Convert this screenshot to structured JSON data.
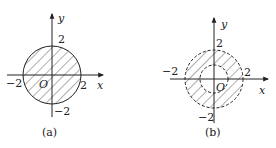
{
  "figures": [
    {
      "id": "a",
      "caption": "(a)",
      "axis_x_label": "x",
      "axis_y_label": "y",
      "origin_label": "O",
      "tick_x_neg": "−2",
      "tick_x_pos": "2",
      "tick_y_pos": "2",
      "tick_y_neg": "−2",
      "description": "Solid circle of radius 2 centered at origin, entire disk hatched"
    },
    {
      "id": "b",
      "caption": "(b)",
      "axis_x_label": "x",
      "axis_y_label": "y",
      "origin_label": "O",
      "tick_x_neg": "−2",
      "tick_x_pos": "2",
      "tick_y_pos": "2",
      "tick_y_neg": "−2",
      "description": "Dashed outer circle radius 2 and dashed inner circle radius 1; annulus hatched"
    }
  ],
  "colors": {
    "stroke": "#222222",
    "background": "#ffffff"
  }
}
